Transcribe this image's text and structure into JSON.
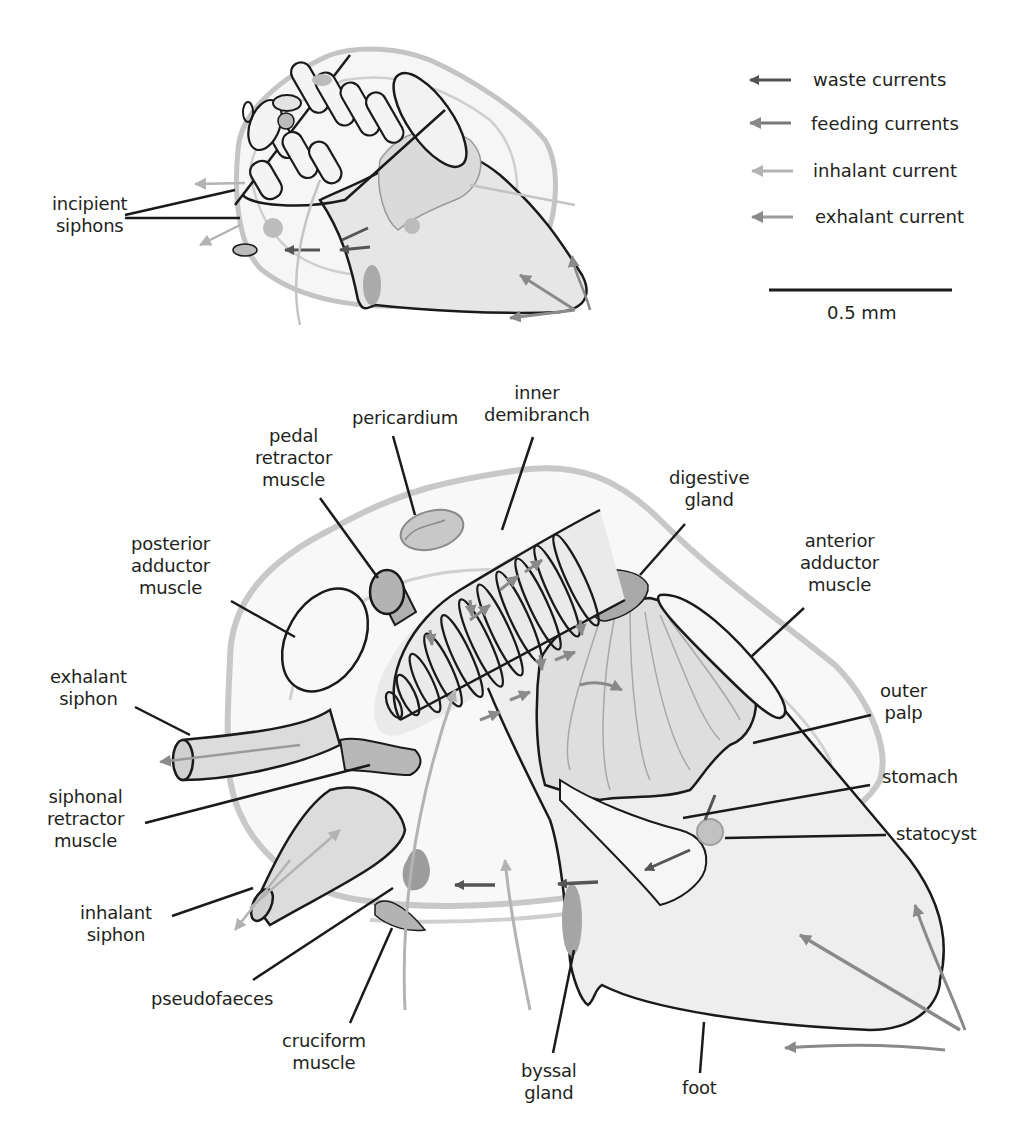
{
  "legend": {
    "items": [
      {
        "label": "waste currents",
        "color": "#555555"
      },
      {
        "label": "feeding currents",
        "color": "#7a7a7a"
      },
      {
        "label": "inhalant current",
        "color": "#b3b3b3"
      },
      {
        "label": "exhalant current",
        "color": "#9a9a9a"
      }
    ],
    "scale_bar": "0.5 mm"
  },
  "small_diagram": {
    "labels": {
      "incipient_siphons": [
        "incipient",
        "siphons"
      ]
    }
  },
  "large_diagram": {
    "labels": {
      "pedal_retractor_muscle": [
        "pedal",
        "retractor",
        "muscle"
      ],
      "pericardium": [
        "pericardium"
      ],
      "inner_demibranch": [
        "inner",
        "demibranch"
      ],
      "digestive_gland": [
        "digestive",
        "gland"
      ],
      "posterior_adductor_muscle": [
        "posterior",
        "adductor",
        "muscle"
      ],
      "anterior_adductor_muscle": [
        "anterior",
        "adductor",
        "muscle"
      ],
      "exhalant_siphon": [
        "exhalant",
        "siphon"
      ],
      "outer_palp": [
        "outer",
        "palp"
      ],
      "siphonal_retractor_muscle": [
        "siphonal",
        "retractor",
        "muscle"
      ],
      "stomach": [
        "stomach"
      ],
      "statocyst": [
        "statocyst"
      ],
      "inhalant_siphon": [
        "inhalant",
        "siphon"
      ],
      "pseudofaeces": [
        "pseudofaeces"
      ],
      "cruciform_muscle": [
        "cruciform",
        "muscle"
      ],
      "byssal_gland": [
        "byssal",
        "gland"
      ],
      "foot": [
        "foot"
      ]
    }
  },
  "colors": {
    "outline": "#1a1a1a",
    "shell": "#bdbdbd",
    "body_fill": "#efefef",
    "organ_fill": "#bcbcbc",
    "dark_organ": "#9a9a9a"
  }
}
